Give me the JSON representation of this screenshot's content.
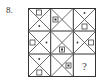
{
  "question": {
    "number_label": "8."
  },
  "puzzle": {
    "rows": 3,
    "cols": 3,
    "cell_motif": "X diagonals (hourglass)",
    "cells": [
      {
        "row": 1,
        "col": 1,
        "square": "top",
        "dot": "bottom",
        "square_filled": false
      },
      {
        "row": 1,
        "col": 2,
        "square": "left",
        "dot": "inside-square",
        "square_filled": true
      },
      {
        "row": 1,
        "col": 3,
        "square": "bottom",
        "dot": "top",
        "square_filled": false
      },
      {
        "row": 2,
        "col": 1,
        "square": "left",
        "dot": "right",
        "square_filled": false
      },
      {
        "row": 2,
        "col": 2,
        "square": "bottom",
        "dot": "inside-square",
        "square_filled": true
      },
      {
        "row": 2,
        "col": 3,
        "square": "right",
        "dot": "left",
        "square_filled": false
      },
      {
        "row": 3,
        "col": 1,
        "square": "bottom",
        "dot": "top",
        "square_filled": false
      },
      {
        "row": 3,
        "col": 2,
        "square": "right",
        "dot": "inside-square",
        "square_filled": true
      },
      {
        "row": 3,
        "col": 3,
        "unknown": true,
        "label": "?"
      }
    ]
  },
  "colors": {
    "line": "#333333",
    "background": "#ffffff"
  }
}
